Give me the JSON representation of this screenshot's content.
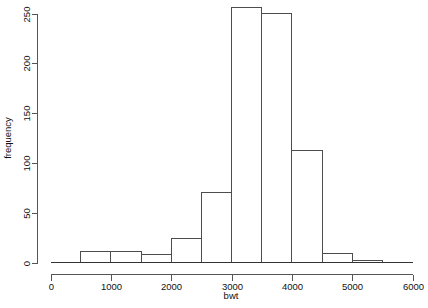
{
  "chart_data": {
    "type": "bar",
    "title": "",
    "subtitle": "",
    "xlabel": "bwt",
    "ylabel": "frequency",
    "xlim": [
      0,
      6000
    ],
    "ylim": [
      0,
      250
    ],
    "grid": false,
    "legend": false,
    "legend_position": "none",
    "bin_width": 500,
    "x_ticks": [
      "0",
      "1000",
      "2000",
      "3000",
      "4000",
      "5000",
      "6000"
    ],
    "x_tick_values": [
      0,
      1000,
      2000,
      3000,
      4000,
      5000,
      6000
    ],
    "y_ticks": [
      "0",
      "50",
      "100",
      "150",
      "200",
      "250"
    ],
    "y_tick_values": [
      0,
      50,
      100,
      150,
      200,
      250
    ],
    "bins": [
      {
        "label": "0-500",
        "start": 0,
        "end": 500,
        "value": 0
      },
      {
        "label": "500-1000",
        "start": 500,
        "end": 1000,
        "value": 11
      },
      {
        "label": "1000-1500",
        "start": 1000,
        "end": 1500,
        "value": 11
      },
      {
        "label": "1500-2000",
        "start": 1500,
        "end": 2000,
        "value": 8
      },
      {
        "label": "2000-2500",
        "start": 2000,
        "end": 2500,
        "value": 24
      },
      {
        "label": "2500-3000",
        "start": 2500,
        "end": 3000,
        "value": 70
      },
      {
        "label": "3000-3500",
        "start": 3000,
        "end": 3500,
        "value": 256
      },
      {
        "label": "3500-4000",
        "start": 3500,
        "end": 4000,
        "value": 250
      },
      {
        "label": "4000-4500",
        "start": 4000,
        "end": 4500,
        "value": 112
      },
      {
        "label": "4500-5000",
        "start": 4500,
        "end": 5000,
        "value": 9
      },
      {
        "label": "5000-5500",
        "start": 5000,
        "end": 5500,
        "value": 2
      },
      {
        "label": "5500-6000",
        "start": 5500,
        "end": 6000,
        "value": 0
      }
    ],
    "categories": [
      "0-500",
      "500-1000",
      "1000-1500",
      "1500-2000",
      "2000-2500",
      "2500-3000",
      "3000-3500",
      "3500-4000",
      "4000-4500",
      "4500-5000",
      "5000-5500",
      "5500-6000"
    ],
    "values": [
      0,
      11,
      11,
      8,
      24,
      70,
      256,
      250,
      112,
      9,
      2,
      0
    ],
    "colors": {
      "bar_stroke": "#4d4d4d",
      "bar_fill": "none",
      "axis": "#555555",
      "text": "#111111",
      "background": "#ffffff"
    }
  }
}
